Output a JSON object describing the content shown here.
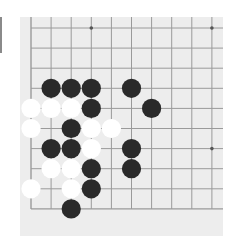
{
  "board": {
    "size_visible": {
      "cols": 10,
      "rows": 10
    },
    "corner": "bottom-left",
    "origin_px": {
      "x": 31,
      "y": 28
    },
    "spacing_px": 20.1,
    "background": "#ededed",
    "line_color": "#9a9a9a",
    "edges": {
      "left": true,
      "bottom": true,
      "top": false,
      "right": false
    },
    "star_points": [
      [
        3,
        0
      ],
      [
        9,
        0
      ],
      [
        9,
        6
      ]
    ],
    "stones": [
      {
        "col": 1,
        "row": 3,
        "color": "black"
      },
      {
        "col": 2,
        "row": 3,
        "color": "black"
      },
      {
        "col": 3,
        "row": 3,
        "color": "black"
      },
      {
        "col": 5,
        "row": 3,
        "color": "black"
      },
      {
        "col": 0,
        "row": 4,
        "color": "white"
      },
      {
        "col": 1,
        "row": 4,
        "color": "white"
      },
      {
        "col": 2,
        "row": 4,
        "color": "white"
      },
      {
        "col": 3,
        "row": 4,
        "color": "black"
      },
      {
        "col": 6,
        "row": 4,
        "color": "black"
      },
      {
        "col": 0,
        "row": 5,
        "color": "white"
      },
      {
        "col": 2,
        "row": 5,
        "color": "black"
      },
      {
        "col": 3,
        "row": 5,
        "color": "white"
      },
      {
        "col": 4,
        "row": 5,
        "color": "white"
      },
      {
        "col": 1,
        "row": 6,
        "color": "black"
      },
      {
        "col": 2,
        "row": 6,
        "color": "black"
      },
      {
        "col": 3,
        "row": 6,
        "color": "white"
      },
      {
        "col": 5,
        "row": 6,
        "color": "black"
      },
      {
        "col": 1,
        "row": 7,
        "color": "white"
      },
      {
        "col": 2,
        "row": 7,
        "color": "white"
      },
      {
        "col": 3,
        "row": 7,
        "color": "black"
      },
      {
        "col": 5,
        "row": 7,
        "color": "black"
      },
      {
        "col": 0,
        "row": 8,
        "color": "white"
      },
      {
        "col": 2,
        "row": 8,
        "color": "white"
      },
      {
        "col": 3,
        "row": 8,
        "color": "black"
      },
      {
        "col": 2,
        "row": 9,
        "color": "black"
      }
    ],
    "stone_colors": {
      "black": "#2a2a2a",
      "white": "#ffffff"
    }
  }
}
